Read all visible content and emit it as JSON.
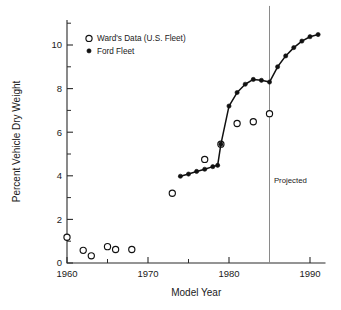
{
  "chart_data": {
    "type": "scatter",
    "title": "",
    "xlabel": "Model Year",
    "ylabel": "Percent Vehicle Dry Weight",
    "xlim": [
      1959,
      1992
    ],
    "ylim": [
      0,
      11
    ],
    "xticks": [
      1960,
      1970,
      1980,
      1990
    ],
    "xtick_labels": [
      "1960",
      "1970",
      "1980",
      "1990"
    ],
    "xminor_ticks": [
      1965,
      1975,
      1985
    ],
    "yticks": [
      0,
      2,
      4,
      6,
      8,
      10
    ],
    "ytick_labels": [
      "0",
      "2",
      "4",
      "6",
      "8",
      "10"
    ],
    "yminor_ticks": [
      1,
      3,
      5,
      7,
      9,
      11
    ],
    "grid": false,
    "legend_position": "upper-left",
    "annotations": [
      {
        "text": "Projected",
        "x": 1985.3,
        "y": 3.65,
        "kind": "vline-label"
      }
    ],
    "vlines": [
      {
        "x": 1985,
        "color": "#8a8a8a",
        "label": "Projected"
      }
    ],
    "series": [
      {
        "name": "Ward's Data (U.S. Fleet)",
        "marker": "open-circle",
        "color": "#111111",
        "line": false,
        "points": [
          {
            "x": 1960,
            "y": 1.18
          },
          {
            "x": 1962,
            "y": 0.58
          },
          {
            "x": 1963,
            "y": 0.33
          },
          {
            "x": 1965,
            "y": 0.75
          },
          {
            "x": 1966,
            "y": 0.62
          },
          {
            "x": 1968,
            "y": 0.62
          },
          {
            "x": 1973,
            "y": 3.2
          },
          {
            "x": 1977,
            "y": 4.75
          },
          {
            "x": 1979,
            "y": 5.45
          },
          {
            "x": 1981,
            "y": 6.4
          },
          {
            "x": 1983,
            "y": 6.48
          },
          {
            "x": 1985,
            "y": 6.85
          }
        ]
      },
      {
        "name": "Ford Fleet",
        "marker": "filled-circle",
        "color": "#111111",
        "line": true,
        "points": [
          {
            "x": 1974,
            "y": 3.98
          },
          {
            "x": 1975,
            "y": 4.08
          },
          {
            "x": 1976,
            "y": 4.2
          },
          {
            "x": 1977,
            "y": 4.3
          },
          {
            "x": 1978,
            "y": 4.42
          },
          {
            "x": 1978.6,
            "y": 4.48
          },
          {
            "x": 1979,
            "y": 5.45
          },
          {
            "x": 1980,
            "y": 7.2
          },
          {
            "x": 1981,
            "y": 7.82
          },
          {
            "x": 1982,
            "y": 8.2
          },
          {
            "x": 1983,
            "y": 8.42
          },
          {
            "x": 1984,
            "y": 8.38
          },
          {
            "x": 1985,
            "y": 8.3
          },
          {
            "x": 1986,
            "y": 9.0
          },
          {
            "x": 1987,
            "y": 9.5
          },
          {
            "x": 1988,
            "y": 9.88
          },
          {
            "x": 1989,
            "y": 10.18
          },
          {
            "x": 1990,
            "y": 10.38
          },
          {
            "x": 1991,
            "y": 10.48
          }
        ]
      }
    ]
  }
}
